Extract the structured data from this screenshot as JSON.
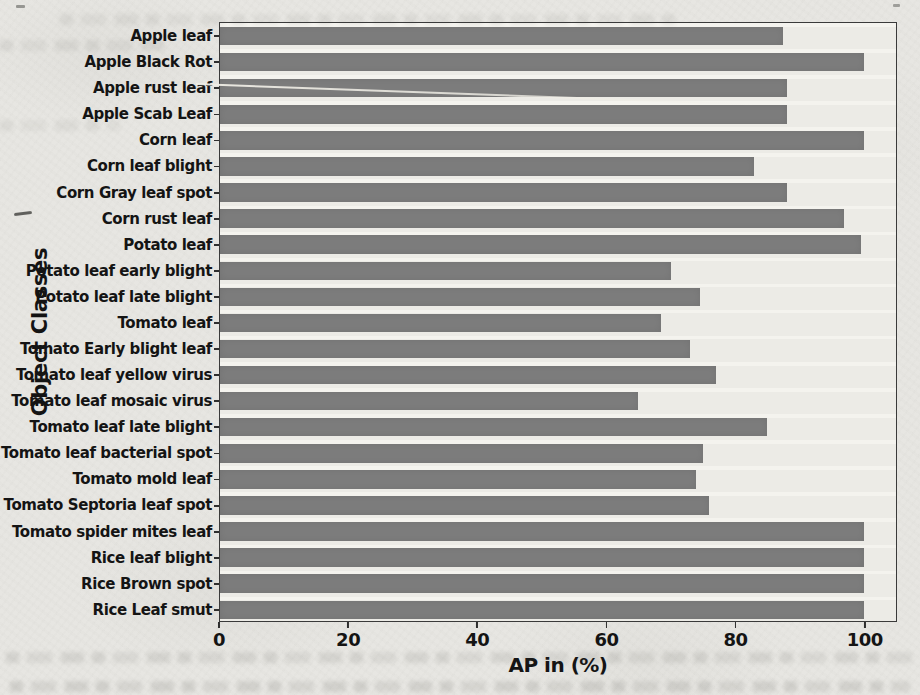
{
  "figure": {
    "xlabel": "AP in (%)",
    "ylabel": "Object Classes"
  },
  "chart_data": {
    "type": "bar",
    "orientation": "horizontal",
    "title": "",
    "xlabel": "AP in (%)",
    "ylabel": "Object Classes",
    "xlim": [
      0,
      105
    ],
    "xticks": [
      0,
      20,
      40,
      60,
      80,
      100
    ],
    "grid": false,
    "legend_position": "none",
    "bar_color": "#7c7c7c",
    "categories": [
      "Apple leaf",
      "Apple Black Rot",
      "Apple rust leaf",
      "Apple Scab Leaf",
      "Corn leaf",
      "Corn leaf blight",
      "Corn Gray leaf spot",
      "Corn rust leaf",
      "Potato leaf",
      "Potato leaf early blight",
      "Potato leaf late blight",
      "Tomato leaf",
      "Tomato Early blight leaf",
      "Tomato leaf yellow virus",
      "Tomato leaf mosaic virus",
      "Tomato leaf late blight",
      "Tomato leaf bacterial spot",
      "Tomato mold leaf",
      "Tomato Septoria leaf spot",
      "Tomato spider mites leaf",
      "Rice leaf blight",
      "Rice Brown spot",
      "Rice Leaf smut"
    ],
    "values": [
      87.5,
      100,
      88,
      88,
      100,
      83,
      88,
      97,
      99.5,
      70,
      74.5,
      68.5,
      73,
      77,
      65,
      85,
      75,
      74,
      76,
      100,
      100,
      100,
      100
    ]
  },
  "colors": {
    "page_background": "#e7e6e2",
    "plot_background": "#ecebe6",
    "bar": "#7c7c7c",
    "frame": "#3a3a3a",
    "text": "#141414"
  }
}
